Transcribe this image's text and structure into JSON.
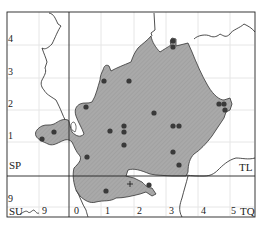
{
  "map": {
    "grid_squares": {
      "top_left": "SP",
      "top_right": "TL",
      "bottom_left": "SU",
      "bottom_right": "TQ"
    },
    "y_labels": [
      {
        "text": "4",
        "x": 9,
        "y": 38
      },
      {
        "text": "3",
        "x": 9,
        "y": 70
      },
      {
        "text": "2",
        "x": 9,
        "y": 103
      },
      {
        "text": "1",
        "x": 9,
        "y": 135
      },
      {
        "text": "9",
        "x": 9,
        "y": 199
      }
    ],
    "x_labels": [
      {
        "text": "9",
        "x": 40,
        "y": 211
      },
      {
        "text": "0",
        "x": 73,
        "y": 211
      },
      {
        "text": "1",
        "x": 104,
        "y": 211
      },
      {
        "text": "2",
        "x": 137,
        "y": 211
      },
      {
        "text": "3",
        "x": 170,
        "y": 211
      },
      {
        "text": "4",
        "x": 201,
        "y": 211
      },
      {
        "text": "5",
        "x": 231,
        "y": 211
      }
    ],
    "square_labels": [
      {
        "text": "SP",
        "x": 10,
        "y": 162
      },
      {
        "text": "TL",
        "x": 240,
        "y": 163
      },
      {
        "text": "SU",
        "x": 10,
        "y": 211
      },
      {
        "text": "TQ",
        "x": 241,
        "y": 211
      }
    ],
    "records": [
      {
        "x": 173,
        "y": 41
      },
      {
        "x": 173,
        "y": 47
      },
      {
        "x": 129,
        "y": 81
      },
      {
        "x": 104,
        "y": 81
      },
      {
        "x": 86,
        "y": 107
      },
      {
        "x": 154,
        "y": 113
      },
      {
        "x": 219,
        "y": 104
      },
      {
        "x": 224,
        "y": 104
      },
      {
        "x": 225,
        "y": 110
      },
      {
        "x": 54,
        "y": 132
      },
      {
        "x": 42,
        "y": 139
      },
      {
        "x": 110,
        "y": 131
      },
      {
        "x": 124,
        "y": 126
      },
      {
        "x": 124,
        "y": 132
      },
      {
        "x": 124,
        "y": 145
      },
      {
        "x": 173,
        "y": 126
      },
      {
        "x": 179,
        "y": 126
      },
      {
        "x": 87,
        "y": 157
      },
      {
        "x": 173,
        "y": 152
      },
      {
        "x": 179,
        "y": 165
      },
      {
        "x": 106,
        "y": 191
      },
      {
        "x": 149,
        "y": 185
      }
    ],
    "cross_marker": {
      "x": 130,
      "y": 184
    },
    "colors": {
      "region_fill": "#a9a9a9",
      "dot": "#3a3a3a",
      "line": "#222222",
      "grid": "#e6e6e6"
    }
  }
}
